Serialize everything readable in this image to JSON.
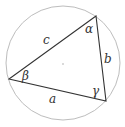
{
  "diagram": {
    "type": "circumscribed-triangle",
    "circle": {
      "cx": 63,
      "cy": 63,
      "r": 57,
      "stroke": "#bbbbbb"
    },
    "center_dot": {
      "x": 63,
      "y": 64
    },
    "vertices": {
      "top": {
        "x": 96,
        "y": 16
      },
      "left": {
        "x": 9,
        "y": 79
      },
      "bottom_right": {
        "x": 106,
        "y": 101
      }
    },
    "triangle_stroke": "#333333",
    "sides": {
      "a": "a",
      "b": "b",
      "c": "c"
    },
    "angles": {
      "alpha": "α",
      "beta": "β",
      "gamma": "γ"
    }
  }
}
